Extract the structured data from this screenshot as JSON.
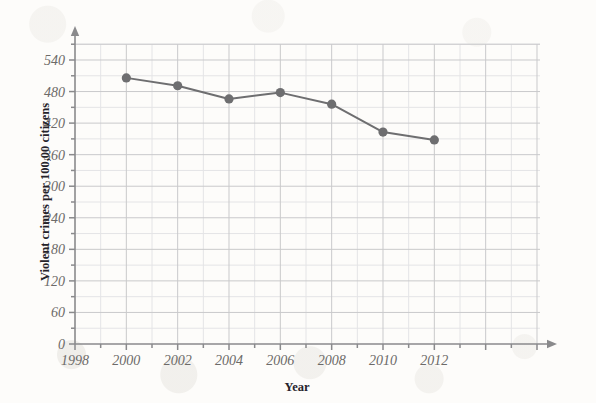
{
  "chart_data": {
    "type": "line",
    "title": "",
    "xlabel": "Year",
    "ylabel": "Violent crimes per 100,00 citizens",
    "x": [
      2000,
      2002,
      2004,
      2006,
      2008,
      2010,
      2012
    ],
    "values": [
      506,
      491,
      466,
      478,
      456,
      403,
      388
    ],
    "categories": [
      "2000",
      "2002",
      "2004",
      "2006",
      "2008",
      "2010",
      "2012"
    ],
    "series": [
      {
        "name": "Violent crime rate",
        "values": [
          506,
          491,
          466,
          478,
          456,
          403,
          388
        ]
      }
    ],
    "xlim": [
      1998,
      2016
    ],
    "ylim": [
      0,
      570
    ],
    "x_major_ticks": [
      1998,
      2000,
      2002,
      2004,
      2006,
      2008,
      2010,
      2012,
      2014,
      2016
    ],
    "x_tick_labels": [
      "1998",
      "2000",
      "2002",
      "2004",
      "2006",
      "2008",
      "2010",
      "2012",
      "",
      ""
    ],
    "x_minor_step": 1,
    "y_major_ticks": [
      0,
      60,
      120,
      180,
      240,
      300,
      360,
      420,
      480,
      540
    ],
    "y_tick_labels": [
      "0",
      "60",
      "120",
      "180",
      "240",
      "300",
      "360",
      "420",
      "480",
      "540"
    ],
    "y_minor_step": 30,
    "grid": true,
    "legend": false,
    "legend_position": "none",
    "marker": "circle",
    "axis_arrows": true
  },
  "axes": {
    "x_title": "Year",
    "y_title": "Violent crimes per 100,00 citizens"
  },
  "colors": {
    "background": "#fdfcfa",
    "series_line": "#6e6e70",
    "marker_fill": "#6e6e70",
    "grid_major": "#c9c9cb",
    "grid_minor": "#e4e4e6",
    "axis": "#8a8a8c",
    "tick_text": "#6c6a68",
    "axis_title_text": "#25232a"
  }
}
